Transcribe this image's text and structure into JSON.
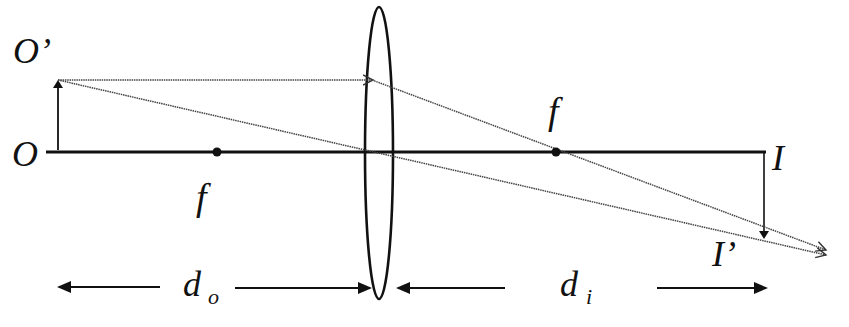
{
  "figure": {
    "colors": {
      "ink": "#111111",
      "ray": "#444444",
      "background": "#ffffff"
    },
    "labels": {
      "object_top": "O’",
      "object_base": "O",
      "focal_left": "f",
      "focal_right": "f",
      "image_base": "I",
      "image_tip": "I’",
      "object_distance_main": "d",
      "object_distance_sub": "o",
      "image_distance_main": "d",
      "image_distance_sub": "i"
    },
    "elements": {
      "optical_axis": "horizontal principal axis",
      "lens": "biconvex converging lens",
      "object_arrow": "upright object arrow O→O’",
      "image_arrow": "inverted real image arrow I→I’",
      "ray_parallel": "ray parallel to axis, refracted through right focal point",
      "ray_center": "ray through lens center, undeviated",
      "focal_point_left": "left focal point",
      "focal_point_right": "right focal point",
      "object_distance_indicator": "object distance d_o",
      "image_distance_indicator": "image distance d_i"
    }
  }
}
